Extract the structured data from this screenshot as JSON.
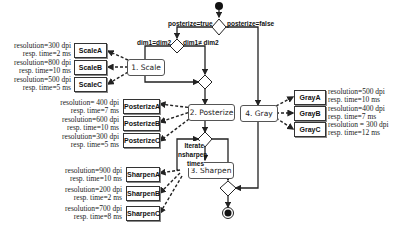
{
  "diagram": {
    "guards": {
      "posterize_true": "posterize=true",
      "posterize_false": "posterize=false",
      "dim_equal": "dim1=dim2",
      "dim_not_equal": "dim1≠ dim2"
    },
    "loop_label": {
      "line1": "Iterate",
      "line2": "nsharpen",
      "line3": "times"
    },
    "activities": {
      "scale": "1. Scale",
      "posterize": "2. Posterize",
      "sharpen": "3. Sharpen",
      "gray": "4. Gray"
    },
    "services": {
      "scale": [
        {
          "name": "ScaleA",
          "resolution": "resolution=300 dpi",
          "resp_time": "resp. time=2 ms"
        },
        {
          "name": "ScaleB",
          "resolution": "resolution=800 dpi",
          "resp_time": "resp. time=10 ms"
        },
        {
          "name": "ScaleC",
          "resolution": "resolution=500 dpi",
          "resp_time": "resp. time=5 ms"
        }
      ],
      "posterize": [
        {
          "name": "PosterizeA",
          "resolution": "resolution= 400 dpi",
          "resp_time": "resp. time=7 ms"
        },
        {
          "name": "PosterizeB",
          "resolution": "resolution=600 dpi",
          "resp_time": "resp. time=10 ms"
        },
        {
          "name": "PosterizeC",
          "resolution": "resolution=300 dpi",
          "resp_time": "resp. time=5 ms"
        }
      ],
      "sharpen": [
        {
          "name": "SharpenA",
          "resolution": "resolution=900 dpi",
          "resp_time": "resp. time=10 ms"
        },
        {
          "name": "SharpenB",
          "resolution": "resolution=200 dpi",
          "resp_time": "resp. time=2 ms"
        },
        {
          "name": "SharpenC",
          "resolution": "resolution=700 dpi",
          "resp_time": "resp. time=8 ms"
        }
      ],
      "gray": [
        {
          "name": "GrayA",
          "resolution": "resolution=500 dpi",
          "resp_time": "resp. time=10 ms"
        },
        {
          "name": "GrayB",
          "resolution": "resolution=400 dpi",
          "resp_time": "resp. time=7 ms"
        },
        {
          "name": "GrayC",
          "resolution": "resolution = 300 dpi",
          "resp_time": "resp. time=12 ms"
        }
      ]
    },
    "colors": {
      "line": "#222222",
      "box_border": "#333333"
    }
  }
}
